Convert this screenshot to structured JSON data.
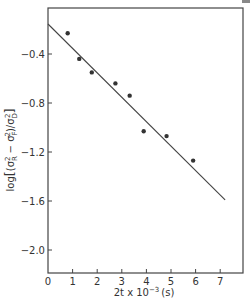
{
  "chart_data": {
    "type": "scatter",
    "title": "",
    "xlabel": "2t x 10^-3 (s)",
    "ylabel": "log[(σR² − σF²)/σD²]",
    "xlim": [
      0,
      8
    ],
    "ylim": [
      -2.2,
      0
    ],
    "x_ticks": [
      0,
      1,
      2,
      3,
      4,
      5,
      6,
      7
    ],
    "y_ticks": [
      -0.4,
      -0.8,
      -1.2,
      -1.6,
      -2.0
    ],
    "y_tick_labels": [
      "-0.4",
      "-0.8",
      "-1.2",
      "-1.6",
      "-2.0"
    ],
    "grid": false,
    "legend": null,
    "series": [
      {
        "name": "measured",
        "type": "scatter",
        "x": [
          0.8,
          1.27,
          1.78,
          2.74,
          3.32,
          3.89,
          4.82,
          5.9
        ],
        "y": [
          -0.23,
          -0.44,
          -0.55,
          -0.64,
          -0.74,
          -1.03,
          -1.07,
          -1.27
        ]
      },
      {
        "name": "fit",
        "type": "line",
        "x": [
          0,
          7.2
        ],
        "y": [
          -0.155,
          -1.59
        ]
      }
    ]
  },
  "labels": {
    "xlabel_main": "2t x 10",
    "xlabel_exp": "−3",
    "xlabel_unit": "(s)",
    "ylabel_prefix": "log",
    "ylabel_body": "(σ",
    "ylabel_r": "R",
    "ylabel_minus": " − σ",
    "ylabel_f": "F",
    "ylabel_close": ")/σ",
    "ylabel_d": "D"
  }
}
